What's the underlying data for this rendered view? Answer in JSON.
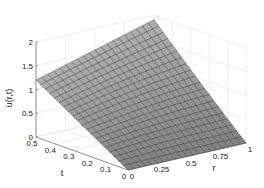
{
  "chart_data": {
    "type": "surface",
    "title": "",
    "xlabel": "r",
    "ylabel": "t",
    "zlabel": "u(r,t)",
    "x_ticks": [
      "0",
      "0.25",
      "0.5",
      "0.75",
      "1"
    ],
    "y_ticks": [
      "0",
      "0.1",
      "0.2",
      "0.3",
      "0.4",
      "0.5"
    ],
    "z_ticks": [
      "0",
      "0.5",
      "1",
      "1.5",
      "2"
    ],
    "xlim": [
      0,
      1
    ],
    "ylim": [
      0,
      0.5
    ],
    "zlim": [
      0,
      2
    ],
    "grid": true,
    "surface_color": "#9a9a9a",
    "edge_color": "#2a2a2a",
    "mesh": {
      "nr": 21,
      "nt": 21
    },
    "corner_values": {
      "r0_t0": 0.0,
      "r1_t0": 0.0,
      "r0_t05": 1.2,
      "r1_t05": 1.9
    }
  }
}
